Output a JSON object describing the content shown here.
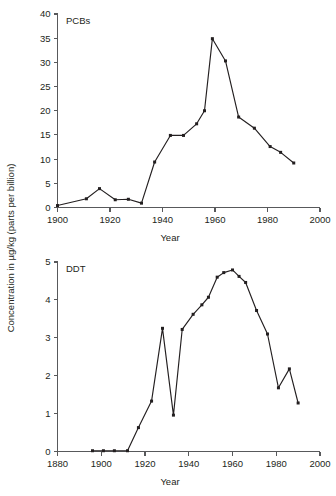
{
  "figure": {
    "shared_ylabel": "Concentration in µg/kg (parts per billion)",
    "background_color": "#ffffff",
    "line_color": "#231f20",
    "axis_color": "#58595b"
  },
  "chart_data": [
    {
      "type": "line",
      "title": "PCBs",
      "xlabel": "Year",
      "ylabel": "Concentration in µg/kg (parts per billion)",
      "xlim": [
        1900,
        2000
      ],
      "ylim": [
        0,
        40
      ],
      "xticks": [
        1900,
        1920,
        1940,
        1960,
        1980,
        2000
      ],
      "xticklabels": [
        "1900",
        "1920",
        "1940",
        "1960",
        "1980",
        "2000"
      ],
      "yticks": [
        0,
        5,
        10,
        15,
        20,
        25,
        30,
        35,
        40
      ],
      "yticklabels": [
        "0",
        "5",
        "10",
        "15",
        "20",
        "25",
        "30",
        "35",
        "40"
      ],
      "grid": false,
      "legend": "none",
      "markers": "square",
      "series": [
        {
          "name": "PCBs",
          "x": [
            1900,
            1911,
            1916,
            1922,
            1927,
            1932,
            1937,
            1943,
            1948,
            1953,
            1956,
            1959,
            1964,
            1969,
            1975,
            1981,
            1985,
            1990
          ],
          "y": [
            0.4,
            1.8,
            3.9,
            1.6,
            1.7,
            0.9,
            9.4,
            14.9,
            14.9,
            17.3,
            20.0,
            34.9,
            30.3,
            18.7,
            16.4,
            12.6,
            11.4,
            9.2
          ]
        }
      ]
    },
    {
      "type": "line",
      "title": "DDT",
      "xlabel": "Year",
      "ylabel": "Concentration in µg/kg (parts per billion)",
      "xlim": [
        1880,
        2000
      ],
      "ylim": [
        0,
        5
      ],
      "xticks": [
        1880,
        1900,
        1920,
        1940,
        1960,
        1980,
        2000
      ],
      "xticklabels": [
        "1880",
        "1900",
        "1920",
        "1940",
        "1960",
        "1980",
        "2000"
      ],
      "yticks": [
        0,
        1,
        2,
        3,
        4,
        5
      ],
      "yticklabels": [
        "0",
        "1",
        "2",
        "3",
        "4",
        "5"
      ],
      "grid": false,
      "legend": "none",
      "markers": "square",
      "series": [
        {
          "name": "DDT",
          "x": [
            1896,
            1901,
            1906,
            1912,
            1917,
            1923,
            1928,
            1933,
            1937,
            1942,
            1946,
            1949,
            1953,
            1956,
            1960,
            1963,
            1966,
            1971,
            1976,
            1981,
            1986,
            1990
          ],
          "y": [
            0.02,
            0.02,
            0.02,
            0.02,
            0.63,
            1.33,
            3.25,
            0.96,
            3.22,
            3.62,
            3.87,
            4.07,
            4.6,
            4.72,
            4.79,
            4.62,
            4.46,
            3.72,
            3.1,
            1.68,
            2.18,
            1.28
          ]
        }
      ]
    }
  ]
}
